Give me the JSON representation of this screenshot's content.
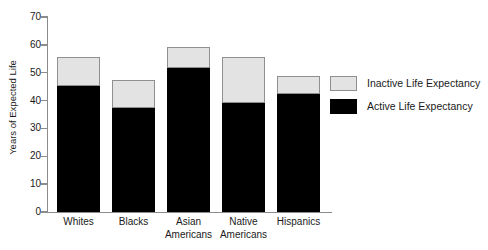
{
  "chart_data": {
    "type": "bar",
    "stacked": true,
    "title": "",
    "xlabel": "",
    "ylabel": "Years of Expected Life",
    "ylim": [
      0,
      70
    ],
    "ytick_values": [
      0,
      10,
      20,
      30,
      40,
      50,
      60,
      70
    ],
    "ytick_labels": [
      "0",
      "10",
      "20",
      "30",
      "40",
      "50",
      "60",
      "70"
    ],
    "grid": false,
    "legend_position": "right",
    "categories": [
      "Whites",
      "Blacks",
      "Asian Americans",
      "Native Americans",
      "Hispanics"
    ],
    "category_lines": [
      [
        "Whites"
      ],
      [
        "Blacks"
      ],
      [
        "Asian",
        "Americans"
      ],
      [
        "Native",
        "Americans"
      ],
      [
        "Hispanics"
      ]
    ],
    "series": [
      {
        "name": "Active Life Expectancy",
        "color": "#000000",
        "values": [
          45.2,
          37.3,
          51.7,
          39.1,
          42.3
        ]
      },
      {
        "name": "Inactive Life Expectancy",
        "color": "#e3e3e3",
        "values": [
          10.4,
          10.1,
          7.5,
          16.5,
          6.5
        ]
      }
    ],
    "totals": [
      55.6,
      47.4,
      59.2,
      55.6,
      48.8
    ]
  },
  "legend": {
    "items": [
      {
        "label": "Inactive Life Expectancy",
        "swatch": "inactive"
      },
      {
        "label": "Active Life Expectancy",
        "swatch": "active"
      }
    ]
  },
  "colors": {
    "active": "#000000",
    "inactive": "#e3e3e3",
    "axis": "#8c8c8c",
    "text": "#1a1a1a",
    "background": "#ffffff"
  }
}
